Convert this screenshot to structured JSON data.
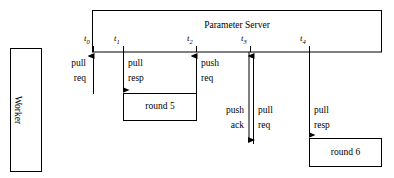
{
  "figure": {
    "type": "sequence-timeline-diagram",
    "background_color": "#ffffff",
    "line_color": "#000000",
    "width": 394,
    "height": 178
  },
  "actors": {
    "worker": {
      "label": "Worker",
      "orientation": "vertical"
    },
    "parameter_server": {
      "label": "Parameter Server",
      "orientation": "horizontal"
    }
  },
  "timeline": {
    "ticks": [
      {
        "id": "t0",
        "label": "t",
        "subscript": "0"
      },
      {
        "id": "t1",
        "label": "t",
        "subscript": "1"
      },
      {
        "id": "t2",
        "label": "t",
        "subscript": "2"
      },
      {
        "id": "t3",
        "label": "t",
        "subscript": "3"
      },
      {
        "id": "t4",
        "label": "t",
        "subscript": "4"
      }
    ]
  },
  "messages": [
    {
      "id": "m0",
      "at": "t0",
      "direction": "up",
      "line1": "pull",
      "line2": "req",
      "side": "left"
    },
    {
      "id": "m1",
      "at": "t1",
      "direction": "down",
      "line1": "pull",
      "line2": "resp",
      "side": "right"
    },
    {
      "id": "m2",
      "at": "t2",
      "direction": "up",
      "line1": "push",
      "line2": "req",
      "side": "right"
    },
    {
      "id": "m3",
      "at": "t3",
      "direction": "down",
      "line1": "push",
      "line2": "ack",
      "side": "left"
    },
    {
      "id": "m4",
      "at": "t3",
      "direction": "up",
      "line1": "pull",
      "line2": "req",
      "side": "right"
    },
    {
      "id": "m5",
      "at": "t4",
      "direction": "down",
      "line1": "pull",
      "line2": "resp",
      "side": "right"
    }
  ],
  "rounds": [
    {
      "id": "round5",
      "label": "round 5"
    },
    {
      "id": "round6",
      "label": "round 6"
    }
  ]
}
